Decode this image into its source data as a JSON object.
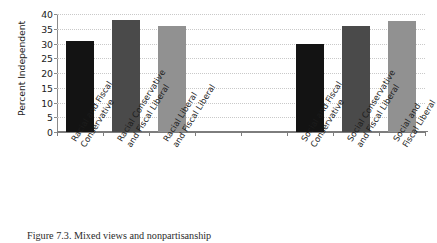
{
  "figure": {
    "caption": "Figure 7.3. Mixed views and nonpartisanship"
  },
  "chart_data": {
    "type": "bar",
    "title": "",
    "xlabel": "",
    "ylabel": "Percent Independent",
    "ylim": [
      0,
      40
    ],
    "ytick_values": [
      0,
      5,
      10,
      15,
      20,
      25,
      30,
      35,
      40
    ],
    "ytick_labels": [
      "0",
      "5",
      "10",
      "15",
      "20",
      "25",
      "30",
      "35",
      "40"
    ],
    "grid": true,
    "legend": "none",
    "categories": [
      "Racial and Fiscal Conservative",
      "Racial Conservative and Fiscal Liberal",
      "Racial Liberal and Fiscal Liberal",
      "Social and Fiscal Conservative",
      "Social Conservative and Fiscal Liberal",
      "Social and Fiscal Liberal"
    ],
    "values": [
      31,
      38,
      36,
      30,
      36,
      37.5
    ],
    "bar_colors": [
      "#131313",
      "#4a4a4a",
      "#919191",
      "#131313",
      "#4a4a4a",
      "#919191"
    ],
    "bars": [
      {
        "label_line1": "Racial and Fiscal",
        "label_line2": "Conservative",
        "value": 31,
        "color": "#131313",
        "slot": 0
      },
      {
        "label_line1": "Racial  Conservative",
        "label_line2": "and Fiscal Liberal",
        "value": 38,
        "color": "#4a4a4a",
        "slot": 1
      },
      {
        "label_line1": "Racial Liberal",
        "label_line2": "and Fiscal Liberal",
        "value": 36,
        "color": "#919191",
        "slot": 2
      },
      {
        "label_line1": "Social and Fiscal",
        "label_line2": "Conservative",
        "value": 30,
        "color": "#131313",
        "slot": 5
      },
      {
        "label_line1": "Social Conservative",
        "label_line2": "and Fiscal Liberal",
        "value": 36,
        "color": "#4a4a4a",
        "slot": 6
      },
      {
        "label_line1": "Social and",
        "label_line2": "Fiscal Liberal",
        "value": 37.5,
        "color": "#919191",
        "slot": 7
      }
    ],
    "slot_count": 8
  }
}
